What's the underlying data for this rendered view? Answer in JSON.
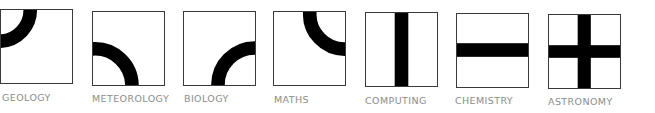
{
  "tiles": [
    {
      "id": "geology",
      "label": "GEOLOGY",
      "motif": "quarter-arc-top-left"
    },
    {
      "id": "meteorology",
      "label": "METEOROLOGY",
      "motif": "quarter-arc-bottom-left"
    },
    {
      "id": "biology",
      "label": "BIOLOGY",
      "motif": "quarter-arc-bottom-right"
    },
    {
      "id": "maths",
      "label": "MATHS",
      "motif": "quarter-arc-top-right"
    },
    {
      "id": "computing",
      "label": "COMPUTING",
      "motif": "vertical-bar"
    },
    {
      "id": "chemistry",
      "label": "CHEMISTRY",
      "motif": "horizontal-bar"
    },
    {
      "id": "astronomy",
      "label": "ASTRONOMY",
      "motif": "cross"
    }
  ],
  "colors": {
    "stroke": "#000000",
    "border": "#3a3a3a",
    "label": "#8c8c8c",
    "background": "#ffffff"
  }
}
